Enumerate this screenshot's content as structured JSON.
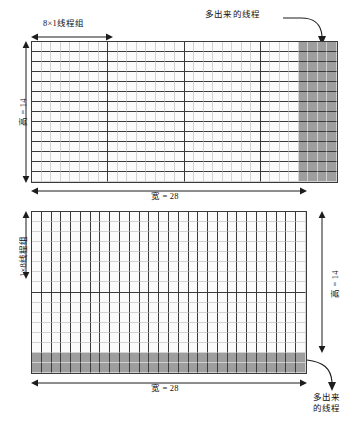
{
  "diagram": {
    "title_semantic": "cuda-thread-block-mapping",
    "colors": {
      "surplus_fill": "#9e9e9e",
      "grid_line_light": "#d2d2d2",
      "grid_line_dark": "#3a3a3a",
      "arrow": "#1d1d1d"
    }
  },
  "top": {
    "block_label": "8×1线程组",
    "surplus_label": "多出来的线程",
    "height_label": "高 = 14",
    "width_label": "宽 = 28",
    "grid": {
      "cols": 32,
      "rows": 14,
      "block_cols": 8,
      "block_rows": 1,
      "surplus_cols_start": 28,
      "surplus_cols": 4
    }
  },
  "bottom": {
    "block_label": "1×8线程组",
    "surplus_label_line1": "多出来",
    "surplus_label_line2": "的线程",
    "height_label": "高 = 14",
    "width_label": "宽 = 28",
    "grid": {
      "cols": 28,
      "rows": 16,
      "block_cols": 1,
      "block_rows": 8,
      "surplus_rows_start": 14,
      "surplus_rows": 2
    }
  }
}
